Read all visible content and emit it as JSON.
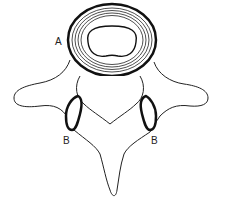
{
  "diagram": {
    "labels": {
      "A": "A",
      "B_left": "B",
      "B_right": "B"
    },
    "colors": {
      "stroke": "#111111",
      "background": "#ffffff"
    }
  }
}
